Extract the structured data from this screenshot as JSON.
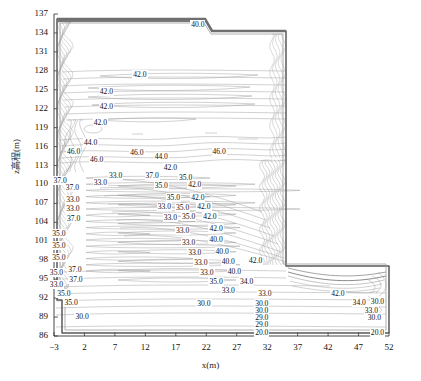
{
  "figure": {
    "background": "#ffffff",
    "line_color": "#8a8a8a",
    "boundary_color": "#555555",
    "text_color": "#111111"
  },
  "axes": {
    "x_title": "x(m)",
    "y_title": "z高程(m)",
    "x_ticks": [
      -3,
      2,
      7,
      12,
      17,
      22,
      27,
      32,
      37,
      42,
      47,
      52
    ],
    "y_ticks": [
      86,
      89,
      92,
      95,
      98,
      101,
      104,
      107,
      110,
      113,
      116,
      119,
      122,
      125,
      128,
      131,
      134,
      137
    ],
    "x_range": [
      -3,
      52
    ],
    "y_range": [
      86,
      137
    ],
    "grid": false
  },
  "chart_data": {
    "type": "contour",
    "title": "",
    "xlabel": "x(m)",
    "ylabel": "z高程(m)",
    "xlim": [
      -3,
      52
    ],
    "ylim": [
      86,
      137
    ],
    "grid": false,
    "levels": [
      20.0,
      29.0,
      30.0,
      33.0,
      34.0,
      35.0,
      37.0,
      40.0,
      42.0,
      44.0,
      46.0
    ],
    "colormap": "grayscale",
    "legend": "none",
    "inline_labels": [
      {
        "text": "40.0",
        "x": 21.0,
        "z": 135.2
      },
      {
        "text": "42.0",
        "x": 11.5,
        "z": 127.4
      },
      {
        "text": "42.0",
        "x": 6.0,
        "z": 124.6
      },
      {
        "text": "42.0",
        "x": 6.0,
        "z": 122.3
      },
      {
        "text": "42.0",
        "x": 5.0,
        "z": 119.8
      },
      {
        "text": "44.0",
        "x": 3.4,
        "z": 116.6
      },
      {
        "text": "46.0",
        "x": 0.6,
        "z": 115.1
      },
      {
        "text": "46.0",
        "x": 4.4,
        "z": 113.8
      },
      {
        "text": "46.0",
        "x": 11.0,
        "z": 115.0
      },
      {
        "text": "44.0",
        "x": 15.0,
        "z": 114.4
      },
      {
        "text": "46.0",
        "x": 24.5,
        "z": 115.2
      },
      {
        "text": "42.0",
        "x": 16.5,
        "z": 112.6
      },
      {
        "text": "37.0",
        "x": 13.5,
        "z": 111.4
      },
      {
        "text": "33.0",
        "x": 7.5,
        "z": 111.3
      },
      {
        "text": "35.0",
        "x": 19.0,
        "z": 111.0
      },
      {
        "text": "37.0",
        "x": -1.6,
        "z": 110.6
      },
      {
        "text": "37.0",
        "x": 0.4,
        "z": 109.4
      },
      {
        "text": "33.0",
        "x": 5.0,
        "z": 110.2
      },
      {
        "text": "35.0",
        "x": 15.0,
        "z": 109.8
      },
      {
        "text": "42.0",
        "x": 20.5,
        "z": 109.9
      },
      {
        "text": "33.0",
        "x": 0.5,
        "z": 107.6
      },
      {
        "text": "35.0",
        "x": 17.0,
        "z": 107.9
      },
      {
        "text": "42.0",
        "x": 21.0,
        "z": 107.9
      },
      {
        "text": "33.0",
        "x": 0.5,
        "z": 106.1
      },
      {
        "text": "33.0",
        "x": 15.5,
        "z": 106.4
      },
      {
        "text": "35.0",
        "x": 18.5,
        "z": 106.3
      },
      {
        "text": "42.0",
        "x": 22.0,
        "z": 106.4
      },
      {
        "text": "37.0",
        "x": 0.6,
        "z": 104.6
      },
      {
        "text": "33.0",
        "x": 16.5,
        "z": 104.7
      },
      {
        "text": "35.0",
        "x": 19.5,
        "z": 104.8
      },
      {
        "text": "42.0",
        "x": 23.0,
        "z": 104.8
      },
      {
        "text": "35.0",
        "x": -1.8,
        "z": 102.1
      },
      {
        "text": "33.0",
        "x": 18.5,
        "z": 102.6
      },
      {
        "text": "42.0",
        "x": 24.0,
        "z": 103.0
      },
      {
        "text": "35.0",
        "x": -1.8,
        "z": 100.2
      },
      {
        "text": "33.0",
        "x": 19.5,
        "z": 100.8
      },
      {
        "text": "40.0",
        "x": 24.0,
        "z": 101.2
      },
      {
        "text": "35.0",
        "x": -1.8,
        "z": 98.4
      },
      {
        "text": "33.0",
        "x": 20.5,
        "z": 99.2
      },
      {
        "text": "40.0",
        "x": 25.0,
        "z": 99.3
      },
      {
        "text": "33.0",
        "x": 21.5,
        "z": 97.6
      },
      {
        "text": "40.0",
        "x": 26.0,
        "z": 97.7
      },
      {
        "text": "42.0",
        "x": 30.5,
        "z": 97.9
      },
      {
        "text": "35.0",
        "x": -2.2,
        "z": 96.0
      },
      {
        "text": "37.0",
        "x": 0.8,
        "z": 96.4
      },
      {
        "text": "33.0",
        "x": 22.5,
        "z": 96.0
      },
      {
        "text": "40.0",
        "x": 27.0,
        "z": 96.1
      },
      {
        "text": "33.0",
        "x": -2.2,
        "z": 94.0
      },
      {
        "text": "37.0",
        "x": 1.0,
        "z": 94.8
      },
      {
        "text": "35.0",
        "x": 24.0,
        "z": 94.5
      },
      {
        "text": "34.0",
        "x": 29.0,
        "z": 94.6
      },
      {
        "text": "35.0",
        "x": -1.0,
        "z": 92.6
      },
      {
        "text": "33.0",
        "x": 26.0,
        "z": 93.2
      },
      {
        "text": "35.0",
        "x": 0.2,
        "z": 91.2
      },
      {
        "text": "33.0",
        "x": 32.0,
        "z": 92.6
      },
      {
        "text": "42.0",
        "x": 44.0,
        "z": 92.7
      },
      {
        "text": "30.0",
        "x": 22.0,
        "z": 91.0
      },
      {
        "text": "30.0",
        "x": 31.5,
        "z": 91.0
      },
      {
        "text": "34.0",
        "x": 47.5,
        "z": 91.2
      },
      {
        "text": "30.0",
        "x": 50.5,
        "z": 91.4
      },
      {
        "text": "30.0",
        "x": 31.5,
        "z": 90.0
      },
      {
        "text": "33.0",
        "x": 49.5,
        "z": 90.0
      },
      {
        "text": "30.0",
        "x": 2.0,
        "z": 89.0
      },
      {
        "text": "29.0",
        "x": 31.5,
        "z": 88.9
      },
      {
        "text": "30.0",
        "x": 50.0,
        "z": 88.8
      },
      {
        "text": "29.0",
        "x": 31.5,
        "z": 87.8
      },
      {
        "text": "20.0",
        "x": 31.5,
        "z": 86.5
      },
      {
        "text": "20.0",
        "x": 50.5,
        "z": 86.5
      }
    ],
    "domain": {
      "description": "Tall rectangular dam-like body spanning x -3..32 and z 86..137, with a stepped crest near x=21 and a lower horizontal foundation arm extending right to x=52 below z~98",
      "crest_top_z": 137,
      "step_x": 21,
      "arm_x_range": [
        32,
        52
      ],
      "arm_z_range": [
        86,
        98
      ]
    }
  }
}
